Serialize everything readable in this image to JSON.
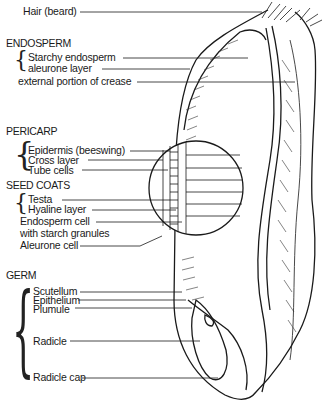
{
  "diagram": {
    "top_label": "Hair (beard)",
    "sections": [
      {
        "heading": "ENDOSPERM",
        "items": [
          "Starchy endosperm",
          "aleurone layer"
        ],
        "extra": "external portion of crease"
      },
      {
        "heading": "PERICARP",
        "items": [
          "Epidermis (beeswing)",
          "Cross layer",
          "Tube cells"
        ]
      },
      {
        "heading": "SEED COATS",
        "items": [
          "Testa",
          "Hyaline layer"
        ],
        "extra_lines": [
          "Endosperm cell",
          "with starch granules",
          "Aleurone cell"
        ]
      },
      {
        "heading": "GERM",
        "items": [
          "Scutellum",
          "Epithelium",
          "Plumule",
          "Radicle",
          "Radicle cap"
        ]
      }
    ],
    "colors": {
      "ink": "#1a1a1a",
      "background": "#ffffff"
    }
  }
}
